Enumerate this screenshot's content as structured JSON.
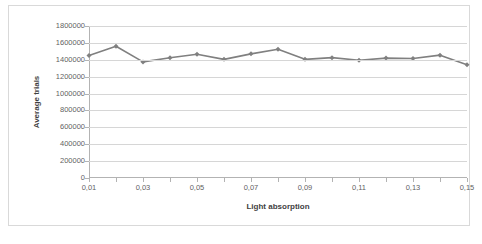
{
  "chart_data": {
    "type": "line",
    "title": "",
    "xlabel": "Light absorption",
    "ylabel": "Average trials",
    "xlim": [
      0.01,
      0.15
    ],
    "ylim": [
      0,
      1800000
    ],
    "grid": true,
    "legend": false,
    "legend_position": "none",
    "marker": "diamond",
    "series_color": "#808080",
    "gridline_color": "#d6d6d6",
    "axis_color": "#b3b3b3",
    "border_color": "#d9d9d9",
    "x": [
      0.01,
      0.02,
      0.03,
      0.04,
      0.05,
      0.06,
      0.07,
      0.08,
      0.09,
      0.1,
      0.11,
      0.12,
      0.13,
      0.14,
      0.15
    ],
    "values": [
      1450000,
      1560000,
      1375000,
      1425000,
      1465000,
      1405000,
      1470000,
      1525000,
      1405000,
      1425000,
      1395000,
      1420000,
      1415000,
      1455000,
      1340000
    ],
    "series": [
      {
        "name": "Average trials",
        "values": [
          1450000,
          1560000,
          1375000,
          1425000,
          1465000,
          1405000,
          1470000,
          1525000,
          1405000,
          1425000,
          1395000,
          1420000,
          1415000,
          1455000,
          1340000
        ]
      }
    ],
    "y_ticks": [
      0,
      200000,
      400000,
      600000,
      800000,
      1000000,
      1200000,
      1400000,
      1600000,
      1800000
    ],
    "y_tick_labels": [
      "0",
      "200000",
      "400000",
      "600000",
      "800000",
      "1000000",
      "1200000",
      "1400000",
      "1600000",
      "1800000"
    ],
    "x_ticks": [
      0.01,
      0.02,
      0.03,
      0.04,
      0.05,
      0.06,
      0.07,
      0.08,
      0.09,
      0.1,
      0.11,
      0.12,
      0.13,
      0.14,
      0.15
    ],
    "x_tick_labels": [
      "0,01",
      "",
      "0,03",
      "",
      "0,05",
      "",
      "0,07",
      "",
      "0,09",
      "",
      "0,11",
      "",
      "0,13",
      "",
      "0,15"
    ]
  }
}
